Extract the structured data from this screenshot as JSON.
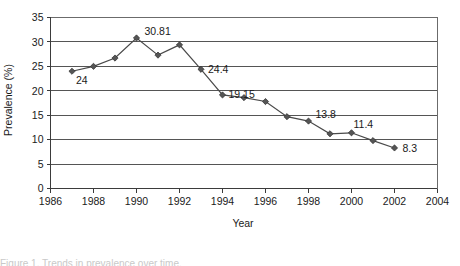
{
  "chart_data": {
    "type": "line",
    "title": "",
    "xlabel": "Year",
    "ylabel": "Prevalence (%)",
    "xlim": [
      1986,
      2004
    ],
    "ylim": [
      0,
      35
    ],
    "xticks": [
      1986,
      1988,
      1990,
      1992,
      1994,
      1996,
      1998,
      2000,
      2002,
      2004
    ],
    "yticks": [
      0,
      5,
      10,
      15,
      20,
      25,
      30,
      35
    ],
    "grid": "horizontal",
    "legend": "none",
    "marker": "diamond",
    "x": [
      1987,
      1988,
      1989,
      1990,
      1991,
      1992,
      1993,
      1994,
      1995,
      1996,
      1997,
      1998,
      1999,
      2000,
      2001,
      2002
    ],
    "values": [
      24,
      25,
      26.7,
      30.81,
      27.3,
      29.4,
      24.4,
      19.15,
      18.6,
      17.8,
      14.7,
      13.8,
      11.2,
      11.4,
      9.8,
      8.3
    ],
    "point_labels": [
      {
        "x": 1987,
        "value": 24,
        "label": "24",
        "dx": 4,
        "dy": 13
      },
      {
        "x": 1990,
        "value": 30.81,
        "label": "30.81",
        "dx": 8,
        "dy": -3
      },
      {
        "x": 1993,
        "value": 24.4,
        "label": "24.4",
        "dx": 7,
        "dy": 4
      },
      {
        "x": 1994,
        "value": 19.15,
        "label": "19.15",
        "dx": 6,
        "dy": 3
      },
      {
        "x": 1998,
        "value": 13.8,
        "label": "13.8",
        "dx": 7,
        "dy": -3
      },
      {
        "x": 2000,
        "value": 11.4,
        "label": "11.4",
        "dx": 2,
        "dy": -5
      },
      {
        "x": 2002,
        "value": 8.3,
        "label": "8.3",
        "dx": 8,
        "dy": 4
      }
    ]
  },
  "axis": {
    "y_title": "Prevalence (%)",
    "x_title": "Year",
    "y_tick_labels": [
      "0",
      "5",
      "10",
      "15",
      "20",
      "25",
      "30",
      "35"
    ],
    "x_tick_labels": [
      "1986",
      "1988",
      "1990",
      "1992",
      "1994",
      "1996",
      "1998",
      "2000",
      "2002",
      "2004"
    ]
  },
  "caption": {
    "text": "Figure 1. Trends in prevalence over time."
  },
  "colors": {
    "line": "#4a4a4a",
    "marker": "#555555",
    "grid": "#555555",
    "axis": "#3b3b3b",
    "text": "#1a1a1a"
  }
}
